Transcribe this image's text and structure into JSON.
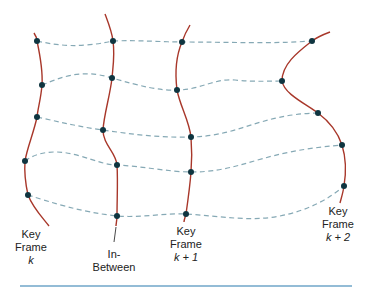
{
  "diagram": {
    "colors": {
      "curve": "#a8372a",
      "correspondence_dashed": "#86a9b5",
      "point": "#0f3540",
      "bottom_rule": "#6fa6c8"
    },
    "frames": [
      {
        "id": "key-frame-k",
        "label_lines": [
          "Key",
          "Frame",
          "k"
        ],
        "points": [
          [
            37,
            41
          ],
          [
            42,
            85
          ],
          [
            37,
            117
          ],
          [
            25,
            161
          ],
          [
            28,
            195
          ]
        ]
      },
      {
        "id": "in-between",
        "label_lines": [
          "In-",
          "Between"
        ],
        "points": [
          [
            113,
            41
          ],
          [
            112,
            78
          ],
          [
            103,
            130
          ],
          [
            117,
            165
          ],
          [
            117,
            216
          ]
        ]
      },
      {
        "id": "key-frame-k-plus-1",
        "label_lines": [
          "Key",
          "Frame",
          "k + 1"
        ],
        "points": [
          [
            182,
            42
          ],
          [
            177,
            90
          ],
          [
            191,
            137
          ],
          [
            191,
            172
          ],
          [
            186,
            214
          ]
        ]
      },
      {
        "id": "key-frame-k-plus-2",
        "label_lines": [
          "Key",
          "Frame",
          "k + 2"
        ],
        "points": [
          [
            312,
            41
          ],
          [
            282,
            81
          ],
          [
            318,
            113
          ],
          [
            342,
            145
          ],
          [
            344,
            186
          ]
        ]
      }
    ],
    "labels": {
      "kf_k": {
        "line1": "Key",
        "line2": "Frame",
        "line3": "k"
      },
      "inbetween": {
        "line1": "In-",
        "line2": "Between"
      },
      "kf_k1": {
        "line1": "Key",
        "line2": "Frame",
        "line3": "k + 1"
      },
      "kf_k2": {
        "line1": "Key",
        "line2": "Frame",
        "line3": "k + 2"
      }
    }
  }
}
